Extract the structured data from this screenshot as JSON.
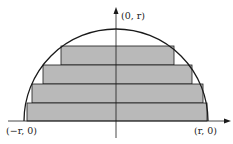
{
  "diagram": {
    "colors": {
      "stroke": "#1a1a1a",
      "fill": "#b9b9b9",
      "background": "#ffffff"
    },
    "center": [
      116,
      121
    ],
    "radius": 92,
    "rectangles": [
      {
        "x1": 61,
        "x2": 174,
        "y1": 46,
        "y2": 65
      },
      {
        "x1": 43,
        "x2": 192,
        "y1": 65,
        "y2": 84
      },
      {
        "x1": 32,
        "x2": 203,
        "y1": 84,
        "y2": 103
      },
      {
        "x1": 27,
        "x2": 207,
        "y1": 103,
        "y2": 121
      }
    ],
    "labels": {
      "top": "(0, r)",
      "left": "(−r, 0)",
      "right": "(r, 0)"
    }
  }
}
